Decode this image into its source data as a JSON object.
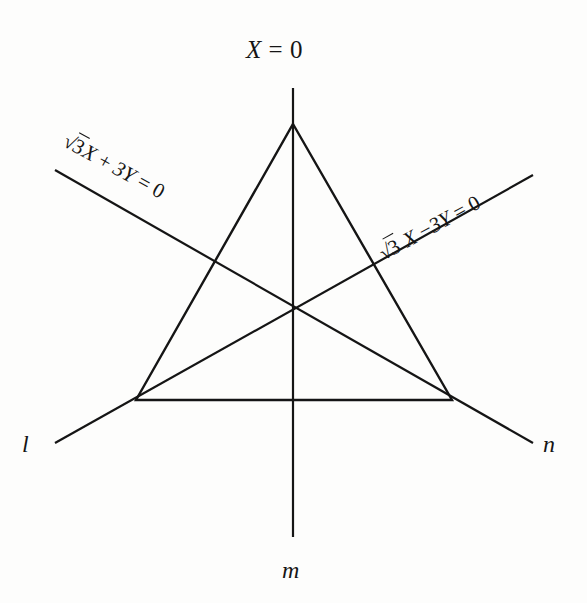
{
  "figure": {
    "background_color": "#fdfdfc",
    "line_color": "#151515",
    "line_width": 2.2,
    "labels": {
      "top_equation": {
        "lhs": "X",
        "operator": "=",
        "rhs": "0",
        "full": "X = 0"
      },
      "left_equation": {
        "radical": "√",
        "radicand": "3",
        "after_radical": "X",
        "operator": "+",
        "term": "3Y",
        "equals": "=",
        "rhs": "0",
        "full": "√3X + 3Y = 0"
      },
      "right_equation": {
        "radical": "√",
        "radicand": "3",
        "after_radical": "X",
        "operator": "−",
        "term": "3Y",
        "equals": "=",
        "rhs": "0",
        "full": "√3 X − 3Y = 0"
      },
      "axis_l": "l",
      "axis_m": "m",
      "axis_n": "n"
    },
    "geometry": {
      "triangle": {
        "apex": [
          293,
          124
        ],
        "bottom_left": [
          136,
          400
        ],
        "bottom_right": [
          452,
          400
        ]
      },
      "centroid": [
        293,
        307
      ],
      "mirror_lines": [
        {
          "name": "m",
          "equation": "X = 0",
          "from": [
            293,
            88
          ],
          "to": [
            293,
            537
          ]
        },
        {
          "name": "l",
          "equation": "√3X + 3Y = 0",
          "from": [
            55,
            170
          ],
          "to": [
            533,
            443
          ]
        },
        {
          "name": "n",
          "equation": "√3 X − 3Y = 0",
          "from": [
            533,
            175
          ],
          "to": [
            55,
            443
          ]
        }
      ]
    }
  }
}
